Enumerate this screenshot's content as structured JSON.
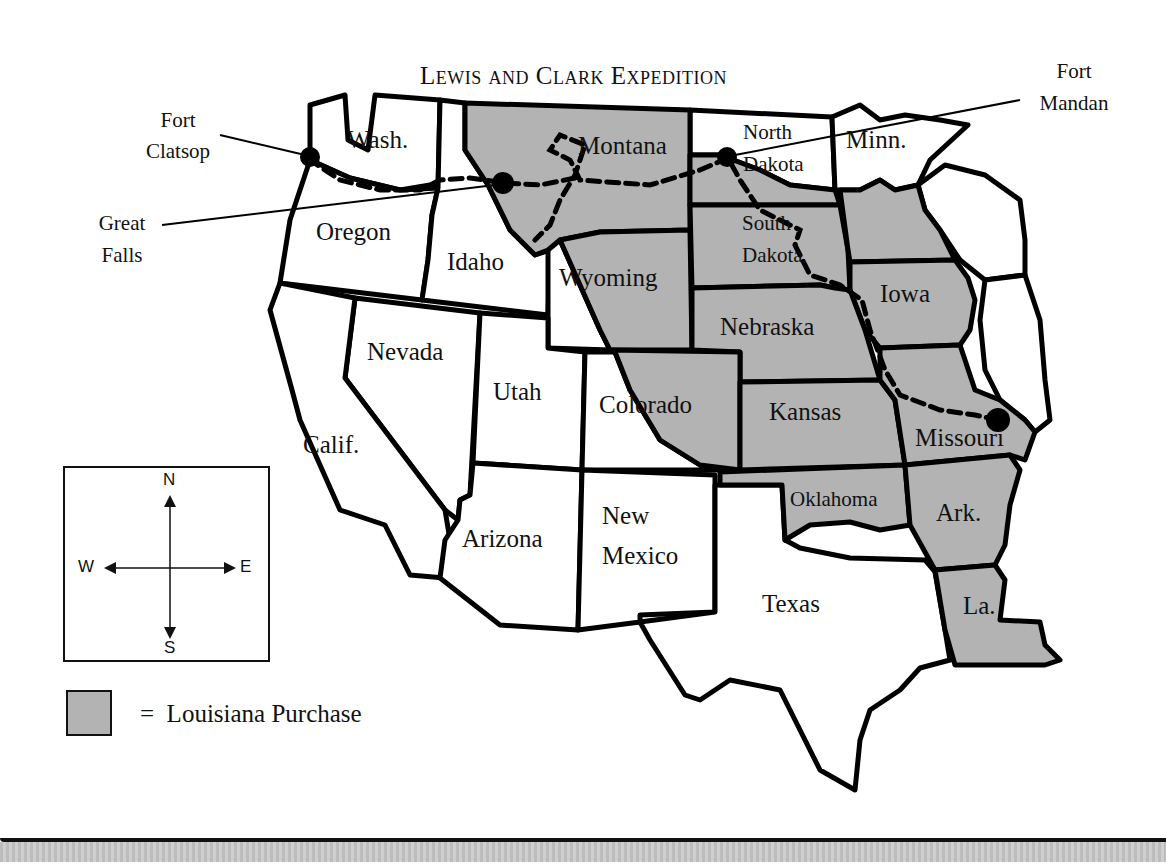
{
  "title": "Lewis and Clark Expedition",
  "callouts": {
    "fort_clatsop": [
      "Fort",
      "Clatsop"
    ],
    "great_falls": [
      "Great",
      "Falls"
    ],
    "fort_mandan": [
      "Fort",
      "Mandan"
    ]
  },
  "states": {
    "wash": "Wash.",
    "oregon": "Oregon",
    "idaho": "Idaho",
    "montana": "Montana",
    "wyoming": "Wyoming",
    "north_dakota": [
      "North",
      "Dakota"
    ],
    "south_dakota": [
      "South",
      "Dakota"
    ],
    "minn": "Minn.",
    "iowa": "Iowa",
    "nebraska": "Nebraska",
    "kansas": "Kansas",
    "missouri": "Missouri",
    "oklahoma": "Oklahoma",
    "ark": "Ark.",
    "la": "La.",
    "texas": "Texas",
    "new_mexico": [
      "New",
      "Mexico"
    ],
    "colorado": "Colorado",
    "utah": "Utah",
    "arizona": "Arizona",
    "nevada": "Nevada",
    "calif": "Calif."
  },
  "compass": {
    "n": "N",
    "s": "S",
    "e": "E",
    "w": "W"
  },
  "legend": {
    "symbol": "=",
    "label": "Louisiana Purchase",
    "swatch_color": "#b3b3b3"
  },
  "colors": {
    "louisiana_purchase_fill": "#b3b3b3",
    "border": "#000000",
    "background": "#ffffff"
  }
}
